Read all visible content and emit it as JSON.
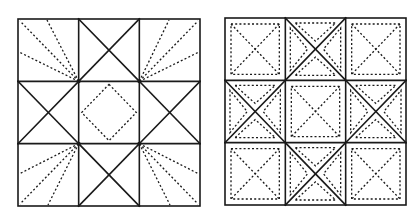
{
  "figure": {
    "panels": [
      {
        "name": "left-quilt-block",
        "bounds": {
          "x0": 18,
          "y0": 19,
          "x1": 200,
          "y1": 206
        },
        "grid": "3x3",
        "description": "Star quilt block: corner cells with dashed fan lines radiating from inner corner, edge cells divided by solid X diagonals, center cell with dashed diamond"
      },
      {
        "name": "right-quilt-block",
        "bounds": {
          "x0": 225,
          "y0": 18,
          "x1": 406,
          "y1": 205
        },
        "grid": "3x3",
        "description": "Star quilt block: corner and center cells with inset dashed square and dashed X; edge cells with solid X and dashed inset triangles in each quadrant"
      }
    ],
    "colors": {
      "line": "#1a1a1a",
      "background": "#ffffff"
    }
  }
}
